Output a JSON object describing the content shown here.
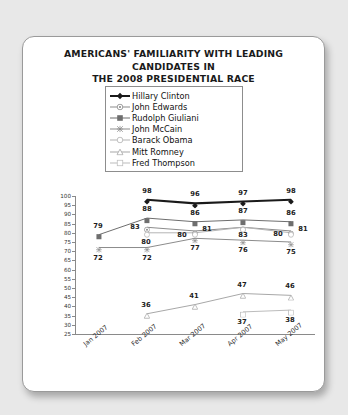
{
  "card": {
    "title_line1": "AMERICANS' FAMILIARITY WITH LEADING CANDIDATES IN",
    "title_line2": "THE 2008 PRESIDENTIAL RACE",
    "subtitle": "(numbers shown in percentages)"
  },
  "legend": {
    "position": "inside-top-center",
    "items": [
      {
        "label": "Hillary Clinton",
        "marker": "filled-diamond-marker",
        "color": "#1a1a1a"
      },
      {
        "label": "John Edwards",
        "marker": "circle-dot-marker",
        "color": "#8c8c8c"
      },
      {
        "label": "Rudolph Giuliani",
        "marker": "filled-square-marker",
        "color": "#6e6e6e"
      },
      {
        "label": "John McCain",
        "marker": "x-cross-marker",
        "color": "#8c8c8c"
      },
      {
        "label": "Barack Obama",
        "marker": "open-circle-marker",
        "color": "#b4b4b4"
      },
      {
        "label": "Mitt Romney",
        "marker": "open-triangle-marker",
        "color": "#a8a8a8"
      },
      {
        "label": "Fred Thompson",
        "marker": "open-square-marker",
        "color": "#bcbcbc"
      }
    ]
  },
  "chart_data": {
    "type": "line",
    "title": "AMERICANS' FAMILIARITY WITH LEADING CANDIDATES IN THE 2008 PRESIDENTIAL RACE",
    "subtitle": "(numbers shown in percentages)",
    "xlabel": "",
    "ylabel": "",
    "categories": [
      "Jan 2007",
      "Feb 2007",
      "Mar 2007",
      "Apr 2007",
      "May 2007"
    ],
    "ylim": [
      25,
      100
    ],
    "yticks": [
      100,
      95,
      90,
      85,
      80,
      75,
      70,
      65,
      60,
      55,
      50,
      45,
      40,
      35,
      30,
      25
    ],
    "grid": false,
    "series": [
      {
        "name": "Hillary Clinton",
        "marker": "filled-diamond-marker",
        "color": "#1a1a1a",
        "width": 2.1,
        "values": [
          null,
          98,
          96,
          97,
          98
        ]
      },
      {
        "name": "Rudolph Giuliani",
        "marker": "filled-square-marker",
        "color": "#6e6e6e",
        "width": 1.0,
        "values": [
          79,
          88,
          86,
          87,
          86
        ]
      },
      {
        "name": "John Edwards",
        "marker": "circle-dot-marker",
        "color": "#8c8c8c",
        "width": 1.0,
        "values": [
          null,
          83,
          81,
          83,
          81
        ]
      },
      {
        "name": "Barack Obama",
        "marker": "open-circle-marker",
        "color": "#b4b4b4",
        "width": 1.0,
        "values": [
          null,
          80,
          80,
          83,
          80
        ]
      },
      {
        "name": "John McCain",
        "marker": "x-cross-marker",
        "color": "#8c8c8c",
        "width": 1.0,
        "values": [
          72,
          72,
          77,
          76,
          75
        ]
      },
      {
        "name": "Mitt Romney",
        "marker": "open-triangle-marker",
        "color": "#a8a8a8",
        "width": 1.0,
        "values": [
          null,
          36,
          41,
          47,
          46
        ]
      },
      {
        "name": "Fred Thompson",
        "marker": "open-square-marker",
        "color": "#bcbcbc",
        "width": 1.0,
        "values": [
          null,
          null,
          null,
          37,
          38
        ]
      }
    ],
    "point_labels": [
      {
        "series": "Rudolph Giuliani",
        "x": "Jan 2007",
        "value": 79,
        "dx": -1,
        "dy": -9
      },
      {
        "series": "John McCain",
        "x": "Jan 2007",
        "value": 72,
        "dx": -1,
        "dy": 10
      },
      {
        "series": "Hillary Clinton",
        "x": "Feb 2007",
        "value": 98,
        "dx": 0,
        "dy": -9
      },
      {
        "series": "Rudolph Giuliani",
        "x": "Feb 2007",
        "value": 88,
        "dx": 0,
        "dy": -9
      },
      {
        "series": "John Edwards",
        "x": "Feb 2007",
        "value": 83,
        "dx": -12,
        "dy": 0
      },
      {
        "series": "Barack Obama",
        "x": "Feb 2007",
        "value": 80,
        "dx": -1,
        "dy": 9
      },
      {
        "series": "John McCain",
        "x": "Feb 2007",
        "value": 72,
        "dx": 0,
        "dy": 10
      },
      {
        "series": "Hillary Clinton",
        "x": "Mar 2007",
        "value": 96,
        "dx": 0,
        "dy": -9
      },
      {
        "series": "Rudolph Giuliani",
        "x": "Mar 2007",
        "value": 86,
        "dx": 0,
        "dy": -9
      },
      {
        "series": "John Edwards",
        "x": "Mar 2007",
        "value": 81,
        "dx": 12,
        "dy": -2
      },
      {
        "series": "Barack Obama",
        "x": "Mar 2007",
        "value": 80,
        "dx": -13,
        "dy": 2
      },
      {
        "series": "John McCain",
        "x": "Mar 2007",
        "value": 77,
        "dx": 0,
        "dy": 10
      },
      {
        "series": "Hillary Clinton",
        "x": "Apr 2007",
        "value": 97,
        "dx": 0,
        "dy": -9
      },
      {
        "series": "Rudolph Giuliani",
        "x": "Apr 2007",
        "value": 87,
        "dx": 0,
        "dy": -9
      },
      {
        "series": "John Edwards",
        "x": "Apr 2007",
        "value": 83,
        "dx": 0,
        "dy": 8
      },
      {
        "series": "John McCain",
        "x": "Apr 2007",
        "value": 76,
        "dx": 0,
        "dy": 10
      },
      {
        "series": "Hillary Clinton",
        "x": "May 2007",
        "value": 98,
        "dx": 0,
        "dy": -9
      },
      {
        "series": "Rudolph Giuliani",
        "x": "May 2007",
        "value": 86,
        "dx": 0,
        "dy": -9
      },
      {
        "series": "John Edwards",
        "x": "May 2007",
        "value": 81,
        "dx": 12,
        "dy": -2
      },
      {
        "series": "Barack Obama",
        "x": "May 2007",
        "value": 80,
        "dx": -13,
        "dy": 1
      },
      {
        "series": "John McCain",
        "x": "May 2007",
        "value": 75,
        "dx": 0,
        "dy": 10
      },
      {
        "series": "Mitt Romney",
        "x": "Feb 2007",
        "value": 36,
        "dx": -1,
        "dy": -9
      },
      {
        "series": "Mitt Romney",
        "x": "Mar 2007",
        "value": 41,
        "dx": -1,
        "dy": -9
      },
      {
        "series": "Mitt Romney",
        "x": "Apr 2007",
        "value": 47,
        "dx": -1,
        "dy": -9
      },
      {
        "series": "Mitt Romney",
        "x": "May 2007",
        "value": 46,
        "dx": -1,
        "dy": -9
      },
      {
        "series": "Fred Thompson",
        "x": "Apr 2007",
        "value": 37,
        "dx": -1,
        "dy": 10
      },
      {
        "series": "Fred Thompson",
        "x": "May 2007",
        "value": 38,
        "dx": -1,
        "dy": 10
      }
    ]
  }
}
